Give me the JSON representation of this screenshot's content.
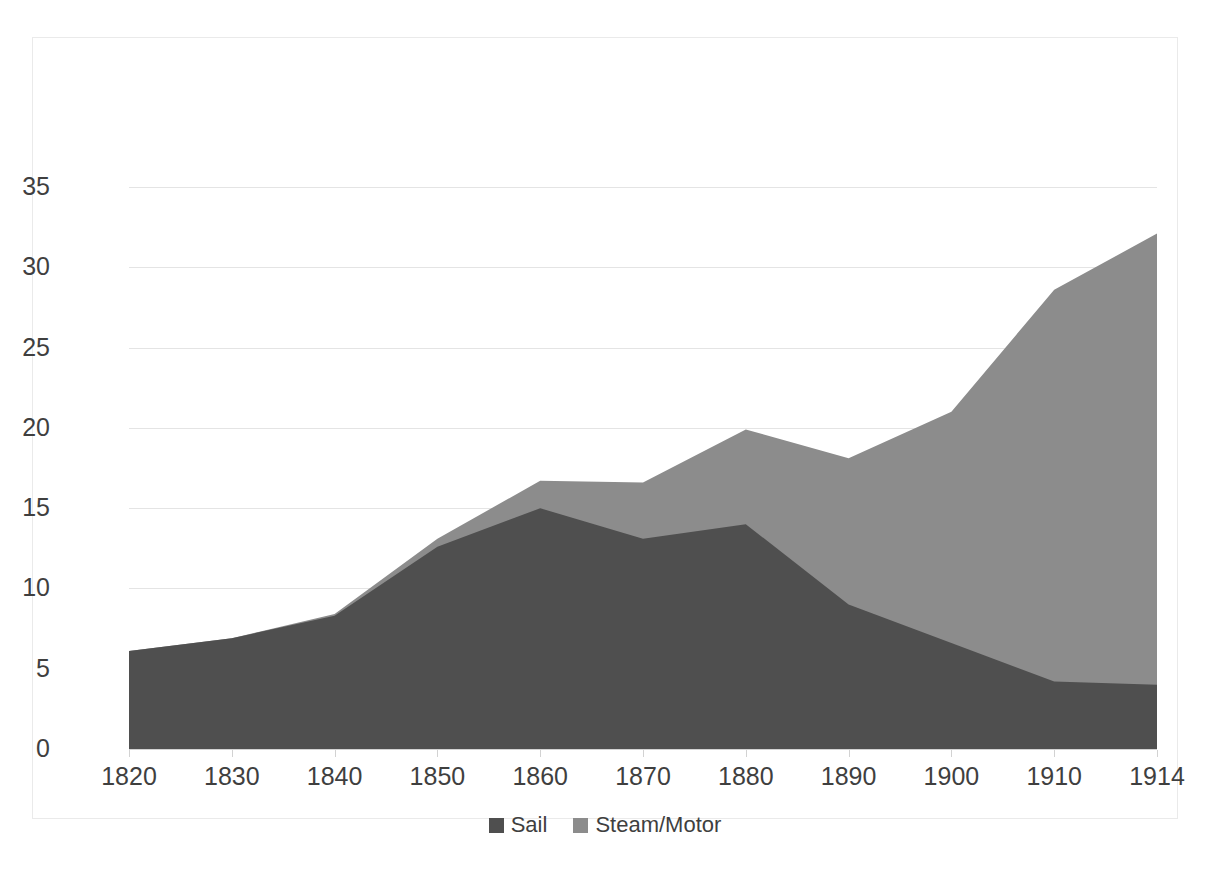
{
  "chart_data": {
    "type": "area",
    "stacked": true,
    "title": "",
    "xlabel": "",
    "ylabel": "",
    "x": [
      1820,
      1830,
      1840,
      1850,
      1860,
      1870,
      1880,
      1890,
      1900,
      1910,
      1914
    ],
    "tick_labels": [
      "1820",
      "1830",
      "1840",
      "1850",
      "1860",
      "1870",
      "1880",
      "1890",
      "1900",
      "1910",
      "1914"
    ],
    "y_ticks": [
      0,
      5,
      10,
      15,
      20,
      25,
      30,
      35
    ],
    "y_tick_labels": [
      "0",
      "5",
      "10",
      "15",
      "20",
      "25",
      "30",
      "35"
    ],
    "xlim": [
      1820,
      1914
    ],
    "ylim": [
      0,
      35
    ],
    "grid": true,
    "legend_position": "bottom",
    "series": [
      {
        "name": "Sail",
        "color": "#4f4f4f",
        "values": [
          6.1,
          6.9,
          8.3,
          12.6,
          15.0,
          13.1,
          14.0,
          9.0,
          6.6,
          4.2,
          4.0
        ]
      },
      {
        "name": "Steam/Motor",
        "color": "#8c8c8c",
        "values": [
          0.0,
          0.0,
          0.1,
          0.5,
          1.7,
          3.5,
          5.9,
          9.1,
          14.4,
          24.4,
          28.1
        ]
      }
    ],
    "totals": [
      6.1,
      6.9,
      8.4,
      13.1,
      16.7,
      16.6,
      19.9,
      18.1,
      21.0,
      28.6,
      32.1
    ]
  },
  "legend": {
    "items": [
      {
        "label": "Sail",
        "color": "#4f4f4f"
      },
      {
        "label": "Steam/Motor",
        "color": "#8c8c8c"
      }
    ]
  },
  "colors": {
    "sail": "#4f4f4f",
    "steam": "#8c8c8c",
    "grid": "#e4e4e4",
    "axis": "#d2d2d2",
    "border": "#eaeaea",
    "text": "#3f3f3f",
    "background": "#ffffff"
  },
  "title_remnant": ""
}
